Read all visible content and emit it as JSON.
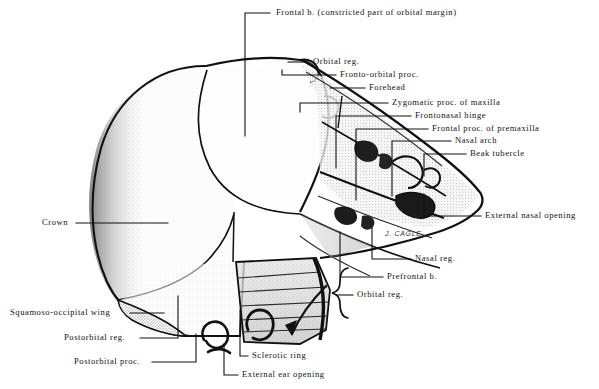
{
  "figure": {
    "signature": "J. CAGLE",
    "background_color": "#ffffff",
    "ink_color": "#111111"
  },
  "labels": [
    {
      "id": "frontal-b",
      "text": "Frontal b. (constricted part of orbital margin)",
      "x": 276,
      "y": 13,
      "align": "left"
    },
    {
      "id": "orbital-reg-top",
      "text": "Orbital reg.",
      "x": 313,
      "y": 62,
      "align": "left"
    },
    {
      "id": "fronto-orbital-proc",
      "text": "Fronto-orbital proc.",
      "x": 340,
      "y": 75,
      "align": "left"
    },
    {
      "id": "forehead",
      "text": "Forehead",
      "x": 369,
      "y": 88,
      "align": "left"
    },
    {
      "id": "zygomatic-proc",
      "text": "Zygomatic proc. of maxilla",
      "x": 392,
      "y": 103,
      "align": "left"
    },
    {
      "id": "frontonasal-hinge",
      "text": "Frontonasal hinge",
      "x": 415,
      "y": 116,
      "align": "left"
    },
    {
      "id": "frontal-proc-premax",
      "text": "Frontal proc. of premaxilla",
      "x": 432,
      "y": 129,
      "align": "left"
    },
    {
      "id": "nasal-arch",
      "text": "Nasal arch",
      "x": 455,
      "y": 141,
      "align": "left"
    },
    {
      "id": "beak-tubercle",
      "text": "Beak tubercle",
      "x": 470,
      "y": 154,
      "align": "left"
    },
    {
      "id": "external-nasal",
      "text": "External nasal opening",
      "x": 485,
      "y": 216,
      "align": "left"
    },
    {
      "id": "nasal-reg",
      "text": "Nasal reg.",
      "x": 415,
      "y": 259,
      "align": "left"
    },
    {
      "id": "prefrontal-b",
      "text": "Prefrontal b.",
      "x": 387,
      "y": 277,
      "align": "left"
    },
    {
      "id": "orbital-reg-bottom",
      "text": "Orbital reg.",
      "x": 357,
      "y": 295,
      "align": "left"
    },
    {
      "id": "crown",
      "text": "Crown",
      "x": 42,
      "y": 223,
      "align": "left"
    },
    {
      "id": "squamoso-occipital",
      "text": "Squamoso-occipital wing",
      "x": 10,
      "y": 313,
      "align": "left"
    },
    {
      "id": "postorbital-reg",
      "text": "Postorbital reg.",
      "x": 64,
      "y": 338,
      "align": "left"
    },
    {
      "id": "postorbital-proc",
      "text": "Postorbital proc.",
      "x": 74,
      "y": 362,
      "align": "left"
    },
    {
      "id": "sclerotic-ring",
      "text": "Sclerotic ring",
      "x": 252,
      "y": 356,
      "align": "left"
    },
    {
      "id": "external-ear",
      "text": "External ear opening",
      "x": 242,
      "y": 375,
      "align": "left"
    }
  ],
  "signature_pos": {
    "x": 385,
    "y": 230
  }
}
